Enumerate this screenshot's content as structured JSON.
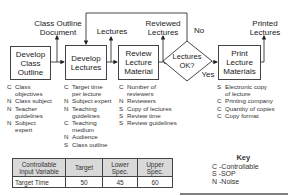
{
  "process": {
    "steps": [
      {
        "id": "develop-class-outline",
        "label": "Develop\nClass\nOutline"
      },
      {
        "id": "develop-lectures",
        "label": "Develop\nLectures"
      },
      {
        "id": "review-lecture-material",
        "label": "Review\nLecture\nMaterial"
      },
      {
        "id": "lectures-ok-decision",
        "label": "Lectures\nOK?"
      },
      {
        "id": "print-lecture-materials",
        "label": "Print\nLecture\nMaterials"
      }
    ],
    "outputs": {
      "class_outline_document": "Class Outline\nDocument",
      "lectures": "Lectures",
      "reviewed_lectures": "Reviewed\nLectures",
      "printed_lectures": "Printed\nLectures"
    },
    "decision_labels": {
      "no": "No",
      "yes": "Yes"
    }
  },
  "inputs": {
    "develop_class_outline": [
      {
        "code": "C",
        "text": "Class\nobjectives"
      },
      {
        "code": "N",
        "text": "Class subject"
      },
      {
        "code": "N",
        "text": "Teacher\nguidelines"
      },
      {
        "code": "N",
        "text": "Subject\nexpert"
      }
    ],
    "develop_lectures": [
      {
        "code": "C",
        "text": "Target time\nper lecture"
      },
      {
        "code": "N",
        "text": "Subject expert"
      },
      {
        "code": "N",
        "text": "Teaching\nguidelines"
      },
      {
        "code": "C",
        "text": "Teaching\nmedium"
      },
      {
        "code": "N",
        "text": "Audience"
      },
      {
        "code": "S",
        "text": "Class outline"
      }
    ],
    "review_lecture_material": [
      {
        "code": "C",
        "text": "Number of\nreviewers"
      },
      {
        "code": "N",
        "text": "Reviewers"
      },
      {
        "code": "S",
        "text": "Copy of lectures"
      },
      {
        "code": "S",
        "text": "Review time"
      },
      {
        "code": "S",
        "text": "Review guidelines"
      }
    ],
    "print_lecture_materials": [
      {
        "code": "S",
        "text": "Electronic copy\nof lecture"
      },
      {
        "code": "C",
        "text": "Printing company"
      },
      {
        "code": "C",
        "text": "Quantity of copies"
      },
      {
        "code": "C",
        "text": "Copy format"
      }
    ]
  },
  "spec_table": {
    "headers": [
      "Controllable\nInput Variable",
      "Target",
      "Lower\nSpec.",
      "Upper\nSpec."
    ],
    "rows": [
      [
        "Target Time",
        "50",
        "45",
        "60"
      ]
    ]
  },
  "key": {
    "title": "Key",
    "items": [
      "C -Controllable",
      "S -SOP",
      "N -Noise"
    ]
  }
}
